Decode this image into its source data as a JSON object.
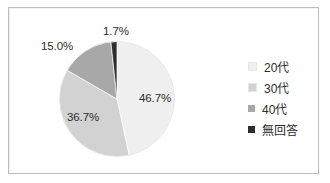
{
  "figure": {
    "frame_border_color": "#b9bcc2",
    "background_color": "#ffffff"
  },
  "chart_data": {
    "type": "pie",
    "title": "",
    "subtitle": "",
    "xlabel": "",
    "ylabel": "",
    "grid": false,
    "legend_position": "right",
    "start_angle_deg": 0,
    "direction": "clockwise",
    "categories": [
      "20代",
      "30代",
      "40代",
      "無回答"
    ],
    "values": [
      46.7,
      36.7,
      15.0,
      1.7
    ],
    "value_unit": "%",
    "data_labels": [
      "46.7%",
      "36.7%",
      "15.0%",
      "1.7%"
    ],
    "colors": [
      "#efefef",
      "#d2d2d2",
      "#a8a8a8",
      "#2e2e2e"
    ],
    "slice_border_color": "#ffffff",
    "slices": [
      {
        "label": "20代",
        "value": 46.7,
        "data_label": "46.7%",
        "color": "#efefef",
        "label_placement": "inside"
      },
      {
        "label": "30代",
        "value": 36.7,
        "data_label": "36.7%",
        "color": "#d2d2d2",
        "label_placement": "inside"
      },
      {
        "label": "40代",
        "value": 15.0,
        "data_label": "15.0%",
        "color": "#a8a8a8",
        "label_placement": "outside"
      },
      {
        "label": "無回答",
        "value": 1.7,
        "data_label": "1.7%",
        "color": "#2e2e2e",
        "label_placement": "outside"
      }
    ]
  },
  "legend": {
    "items": [
      {
        "label": "20代",
        "color": "#efefef"
      },
      {
        "label": "30代",
        "color": "#d2d2d2"
      },
      {
        "label": "40代",
        "color": "#a8a8a8"
      },
      {
        "label": "無回答",
        "color": "#2e2e2e"
      }
    ]
  }
}
